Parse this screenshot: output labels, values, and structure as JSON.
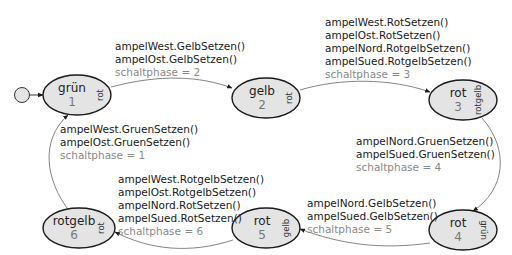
{
  "diagram": {
    "initial": {
      "label": ""
    },
    "states": [
      {
        "id": "s1",
        "name": "grün",
        "number": "1",
        "side": "rot"
      },
      {
        "id": "s2",
        "name": "gelb",
        "number": "2",
        "side": "rot"
      },
      {
        "id": "s3",
        "name": "rot",
        "number": "3",
        "side": "rotgelb"
      },
      {
        "id": "s4",
        "name": "rot",
        "number": "4",
        "side": "grün"
      },
      {
        "id": "s5",
        "name": "rot",
        "number": "5",
        "side": "gelb"
      },
      {
        "id": "s6",
        "name": "rotgelb",
        "number": "6",
        "side": "rot"
      }
    ],
    "transitions": [
      {
        "from": "s1",
        "to": "s2",
        "actions": [
          "ampelWest.GelbSetzen()",
          "ampelOst.GelbSetzen()"
        ],
        "assignment": "schaltphase = 2"
      },
      {
        "from": "s2",
        "to": "s3",
        "actions": [
          "ampelWest.RotSetzen()",
          "ampelOst.RotSetzen()",
          "ampelNord.RotgelbSetzen()",
          "ampelSued.RotgelbSetzen()"
        ],
        "assignment": "schaltphase = 3"
      },
      {
        "from": "s3",
        "to": "s4",
        "actions": [
          "ampelNord.GruenSetzen()",
          "ampelSued.GruenSetzen()"
        ],
        "assignment": "schaltphase = 4"
      },
      {
        "from": "s4",
        "to": "s5",
        "actions": [
          "ampelNord.GelbSetzen()",
          "ampelSued.GelbSetzen()"
        ],
        "assignment": "schaltphase = 5"
      },
      {
        "from": "s5",
        "to": "s6",
        "actions": [
          "ampelWest.RotgelbSetzen()",
          "ampelOst.RotgelbSetzen()",
          "ampelNord.RotSetzen()",
          "ampelSued.RotSetzen()"
        ],
        "assignment": "schaltphase = 6"
      },
      {
        "from": "s6",
        "to": "s1",
        "actions": [
          "ampelWest.GruenSetzen()",
          "ampelOst.GruenSetzen()"
        ],
        "assignment": "schaltphase = 1"
      }
    ]
  }
}
